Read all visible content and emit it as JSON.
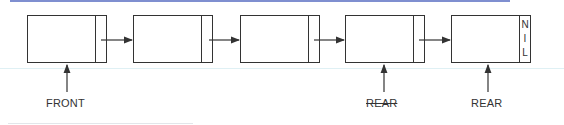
{
  "diagram": {
    "type": "linked-list-queue",
    "nodes": [
      {
        "id": "node-1",
        "pointer_text": ""
      },
      {
        "id": "node-2",
        "pointer_text": ""
      },
      {
        "id": "node-3",
        "pointer_text": ""
      },
      {
        "id": "node-4",
        "pointer_text": ""
      },
      {
        "id": "node-5",
        "pointer_text": "NIL",
        "pointer_chars": [
          "N",
          "I",
          "L"
        ]
      }
    ],
    "labels": {
      "front": "FRONT",
      "old_rear": "REAR",
      "new_rear": "REAR"
    },
    "colors": {
      "line": "#333333",
      "top_rule": "#7f8fd0"
    }
  }
}
